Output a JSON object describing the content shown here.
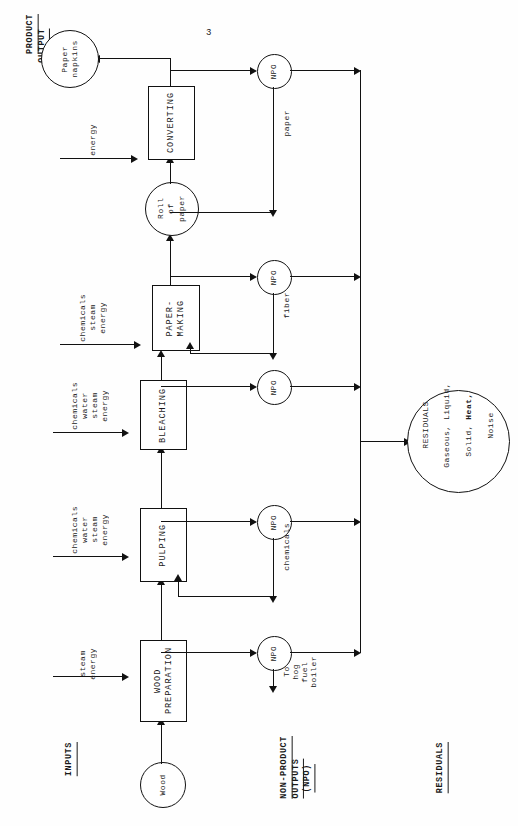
{
  "page": {
    "number": "3"
  },
  "sections": {
    "product_output": "PRODUCT\nOUTPUT",
    "inputs": "INPUTS",
    "non_product_outputs": "NON-PRODUCT\nOUTPUTS\n(NPO)",
    "residuals": "RESIDUALS"
  },
  "nodes": {
    "wood": "Wood",
    "roll_of_paper": "Roll\nof\npaper",
    "paper_napkins": "Paper\nnapkins",
    "residuals_circle": {
      "title": "RESIDUALS",
      "line1": "Gaseous, Liquid,",
      "line2_a": "Solid, ",
      "line2_b": "Heat,",
      "line3": "Noise"
    }
  },
  "processes": [
    {
      "id": "wood-preparation",
      "label": "WOOD\nPREPARATION"
    },
    {
      "id": "pulping",
      "label": "PULPING"
    },
    {
      "id": "bleaching",
      "label": "BLEACHING"
    },
    {
      "id": "paper-making",
      "label": "PAPER-\nMAKING"
    },
    {
      "id": "converting",
      "label": "CONVERTING"
    }
  ],
  "inputs": [
    {
      "for": "wood-preparation",
      "label": "steam\nenergy"
    },
    {
      "for": "pulping",
      "label": "chemicals\nwater\nsteam\nenergy"
    },
    {
      "for": "bleaching",
      "label": "chemicals\nwater\nsteam\nenergy"
    },
    {
      "for": "paper-making",
      "label": "chemicals\nsteam\nenergy"
    },
    {
      "for": "converting",
      "label": "energy"
    }
  ],
  "npo_nodes": [
    {
      "id": "npo-wood-preparation",
      "label": "NPO"
    },
    {
      "id": "npo-pulping",
      "label": "NPO"
    },
    {
      "id": "npo-bleaching",
      "label": "NPO"
    },
    {
      "id": "npo-paper-making",
      "label": "NPO"
    },
    {
      "id": "npo-converting",
      "label": "NPO"
    }
  ],
  "recycle_labels": {
    "hog_fuel": "To\nhog\nfuel\nboiler",
    "chemicals": "chemicals",
    "fiber": "fiber",
    "paper": "paper"
  },
  "colors": {
    "ink": "#111111",
    "paper": "#fefefe"
  }
}
